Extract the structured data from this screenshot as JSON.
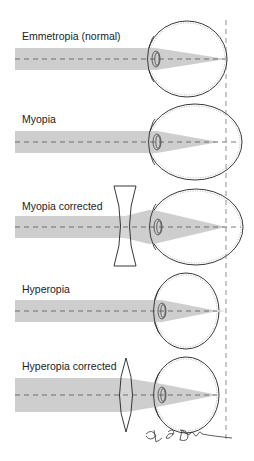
{
  "figure": {
    "width": 254,
    "height": 461,
    "background": "#ffffff",
    "beam_color": "#c9c9c9",
    "line_color": "#222222",
    "retina_reference_line": {
      "x": 226,
      "y1": 20,
      "y2": 440
    }
  },
  "panels": [
    {
      "id": "emmetropia",
      "label": "Emmetropia (normal)",
      "label_pos": [
        22,
        40
      ],
      "axis_y": 59,
      "beam": {
        "x0": 15,
        "half_height": 11,
        "lens_x": 160,
        "focus_x": 226
      },
      "eye": {
        "cx": 187,
        "rx": 40,
        "ry": 38
      },
      "corrective_lens": null
    },
    {
      "id": "myopia",
      "label": "Myopia",
      "label_pos": [
        22,
        123
      ],
      "axis_y": 142,
      "beam": {
        "x0": 15,
        "half_height": 11,
        "lens_x": 160,
        "focus_x": 219
      },
      "eye": {
        "cx": 195,
        "rx": 47,
        "ry": 38
      },
      "corrective_lens": null
    },
    {
      "id": "myopia-corrected",
      "label": "Myopia corrected",
      "label_pos": [
        22,
        210
      ],
      "axis_y": 227,
      "beam": {
        "x0": 15,
        "half_height": 11,
        "lens_x": 160,
        "focus_x": 226
      },
      "eye": {
        "cx": 196,
        "rx": 47,
        "ry": 38
      },
      "corrective_lens": {
        "type": "concave",
        "x": 125,
        "top": 186,
        "bottom": 266
      }
    },
    {
      "id": "hyperopia",
      "label": "Hyperopia",
      "label_pos": [
        22,
        293
      ],
      "axis_y": 311,
      "beam": {
        "x0": 15,
        "half_height": 11,
        "lens_x": 160,
        "focus_x": 218,
        "beyond_x": 226
      },
      "eye": {
        "cx": 186,
        "rx": 33,
        "ry": 38
      },
      "corrective_lens": null
    },
    {
      "id": "hyperopia-corrected",
      "label": "Hyperopia corrected",
      "label_pos": [
        22,
        370
      ],
      "axis_y": 395,
      "beam": {
        "x0": 15,
        "half_height": 17,
        "lens_x": 160,
        "focus_x": 218
      },
      "eye": {
        "cx": 186,
        "rx": 33,
        "ry": 38
      },
      "corrective_lens": {
        "type": "convex",
        "x": 126,
        "top": 358,
        "bottom": 432
      }
    }
  ],
  "signature": {
    "text": "A. L. Dunn",
    "pos": [
      150,
      438
    ]
  }
}
